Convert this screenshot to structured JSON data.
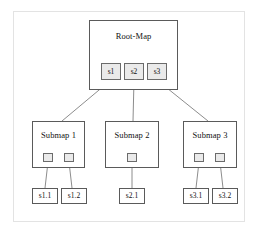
{
  "diagram": {
    "root": {
      "label": "Root-Map",
      "ports": [
        {
          "id": "s1",
          "label": "s1"
        },
        {
          "id": "s2",
          "label": "s2"
        },
        {
          "id": "s3",
          "label": "s3"
        }
      ]
    },
    "submaps": [
      {
        "id": "submap-1",
        "label": "Submap 1",
        "ports": [
          {
            "id": "s1.1"
          },
          {
            "id": "s1.2"
          }
        ],
        "leaves": [
          {
            "label": "s1.1"
          },
          {
            "label": "s1.2"
          }
        ]
      },
      {
        "id": "submap-2",
        "label": "Submap 2",
        "ports": [
          {
            "id": "s2.1"
          }
        ],
        "leaves": [
          {
            "label": "s2.1"
          }
        ]
      },
      {
        "id": "submap-3",
        "label": "Submap 3",
        "ports": [
          {
            "id": "s3.1"
          },
          {
            "id": "s3.2"
          }
        ],
        "leaves": [
          {
            "label": "s3.1"
          },
          {
            "label": "s3.2"
          }
        ]
      }
    ],
    "colors": {
      "frame": "#e3e3e3",
      "box_border": "#5a5a5a",
      "port_fill": "#eaeaea",
      "port_border": "#6b6b6b",
      "connector": "#6e6e6e",
      "text": "#111111",
      "background": "#ffffff"
    }
  }
}
